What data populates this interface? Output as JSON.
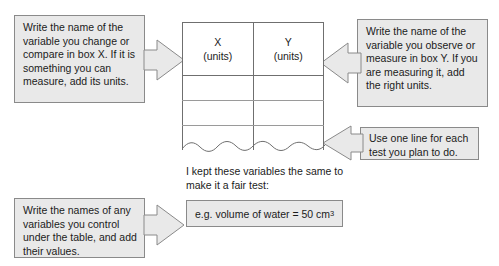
{
  "diagram": {
    "callouts": {
      "x_variable": "Write the name of the variable you change or compare in box X. If it is something you can measure, add its units.",
      "y_variable": "Write the name of the variable you observe or measure in box Y. If you are measuring it, add the right units.",
      "rows": "Use one line for each test you plan to do.",
      "control_variables": "Write the names of any variables you control under the table, and add their values."
    },
    "table": {
      "columns": [
        {
          "symbol": "X",
          "units_label": "(units)"
        },
        {
          "symbol": "Y",
          "units_label": "(units)"
        }
      ],
      "blank_rows": 3,
      "torn_bottom_edge": true
    },
    "fair_test": {
      "caption": "I kept these variables the same to make it a fair test:",
      "example_prefix": "e.g. volume of water = 50 cm",
      "example_superscript": "3"
    },
    "colors": {
      "callout_fill": "#e9e9e9",
      "callout_border": "#8a8a8a",
      "table_border": "#6f6f6f",
      "text": "#1b1b1b",
      "page_background": "#ffffff"
    }
  }
}
